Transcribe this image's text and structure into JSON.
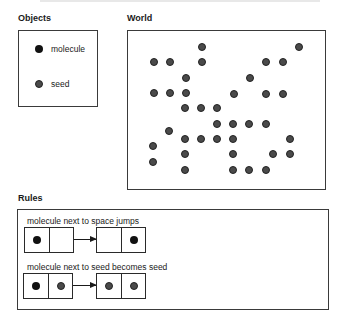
{
  "objects": {
    "heading": "Objects",
    "items": [
      {
        "label": "molecule",
        "kind": "molecule"
      },
      {
        "label": "seed",
        "kind": "seed"
      }
    ]
  },
  "world": {
    "heading": "World",
    "dots": [
      {
        "x": 202,
        "y": 47
      },
      {
        "x": 299,
        "y": 47
      },
      {
        "x": 154,
        "y": 62
      },
      {
        "x": 170,
        "y": 62
      },
      {
        "x": 202,
        "y": 62
      },
      {
        "x": 266,
        "y": 62
      },
      {
        "x": 283,
        "y": 62
      },
      {
        "x": 186,
        "y": 78
      },
      {
        "x": 250,
        "y": 78
      },
      {
        "x": 154,
        "y": 93
      },
      {
        "x": 170,
        "y": 93
      },
      {
        "x": 186,
        "y": 93
      },
      {
        "x": 234,
        "y": 94
      },
      {
        "x": 266,
        "y": 94
      },
      {
        "x": 283,
        "y": 94
      },
      {
        "x": 185,
        "y": 108
      },
      {
        "x": 201,
        "y": 108
      },
      {
        "x": 217,
        "y": 108
      },
      {
        "x": 217,
        "y": 124
      },
      {
        "x": 233,
        "y": 124
      },
      {
        "x": 249,
        "y": 124
      },
      {
        "x": 266,
        "y": 124
      },
      {
        "x": 169,
        "y": 131
      },
      {
        "x": 185,
        "y": 139
      },
      {
        "x": 201,
        "y": 139
      },
      {
        "x": 217,
        "y": 139
      },
      {
        "x": 233,
        "y": 139
      },
      {
        "x": 290,
        "y": 139
      },
      {
        "x": 153,
        "y": 146
      },
      {
        "x": 185,
        "y": 154
      },
      {
        "x": 233,
        "y": 154
      },
      {
        "x": 273,
        "y": 154
      },
      {
        "x": 290,
        "y": 154
      },
      {
        "x": 153,
        "y": 162
      },
      {
        "x": 185,
        "y": 170
      },
      {
        "x": 233,
        "y": 170
      },
      {
        "x": 249,
        "y": 170
      },
      {
        "x": 266,
        "y": 170
      }
    ]
  },
  "rules": {
    "heading": "Rules",
    "items": [
      {
        "label": "molecule next to space jumps",
        "before": [
          "molecule",
          "empty"
        ],
        "after": [
          "empty",
          "molecule"
        ]
      },
      {
        "label": "molecule next to seed becomes seed",
        "before": [
          "molecule",
          "seed"
        ],
        "after": [
          "seed",
          "seed"
        ]
      }
    ]
  },
  "colors": {
    "molecule": "#111111",
    "seed": "#4a4a4a",
    "border": "#3a3a3a"
  }
}
